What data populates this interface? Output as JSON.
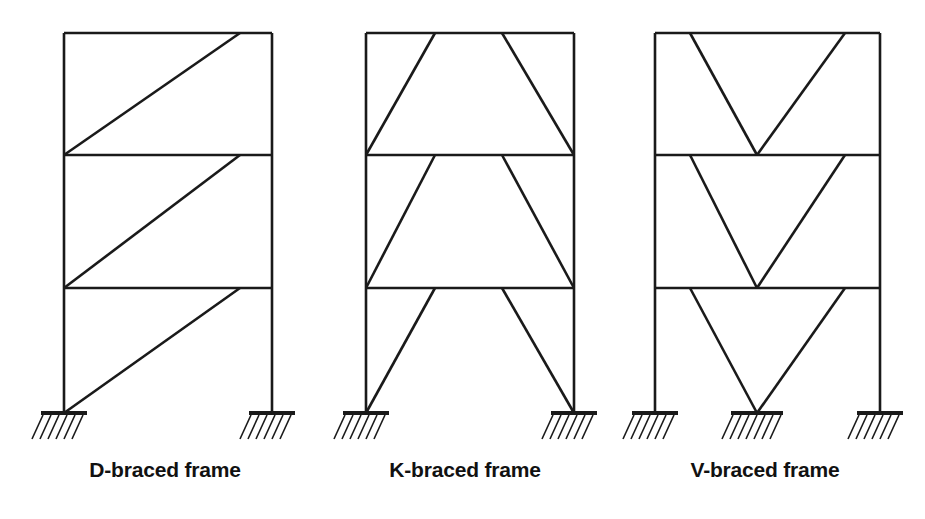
{
  "figure": {
    "type": "engineering-diagram",
    "background_color": "#ffffff",
    "line_color": "#1a1a1a",
    "member_line_width": 2.6,
    "brace_line_width": 2.6,
    "support_line_width": 4.0,
    "hatch_line_width": 1.6
  },
  "labels": {
    "d_frame": "D-braced frame",
    "k_frame": "K-braced frame",
    "v_frame": "V-braced frame"
  },
  "geometry": {
    "story_levels_y": [
      33,
      155,
      288,
      413
    ],
    "roof_y": 33,
    "base_y": 413,
    "stories": 3
  },
  "frames": [
    {
      "id": "d-braced",
      "name": "D-braced frame",
      "label": "D-braced frame",
      "brace_pattern": "single-diagonal",
      "left_column_x": 64,
      "right_column_x": 272,
      "columns": [
        {
          "x": 64,
          "y_top": 33,
          "y_bottom": 413
        },
        {
          "x": 272,
          "y_top": 33,
          "y_bottom": 413
        }
      ],
      "beams": [
        {
          "y": 33,
          "x_left": 64,
          "x_right": 272
        },
        {
          "y": 155,
          "x_left": 64,
          "x_right": 272
        },
        {
          "y": 288,
          "x_left": 64,
          "x_right": 272
        }
      ],
      "braces": [
        {
          "story": 3,
          "x1": 64,
          "y1": 155,
          "x2": 240,
          "y2": 33
        },
        {
          "story": 2,
          "x1": 64,
          "y1": 288,
          "x2": 240,
          "y2": 155
        },
        {
          "story": 1,
          "x1": 64,
          "y1": 413,
          "x2": 240,
          "y2": 288
        }
      ],
      "supports": [
        {
          "x": 64,
          "y": 413,
          "width": 46
        },
        {
          "x": 272,
          "y": 413,
          "width": 46
        }
      ]
    },
    {
      "id": "k-braced",
      "name": "K-braced frame",
      "label": "K-braced frame",
      "brace_pattern": "trapezoid-chevron",
      "left_column_x": 366,
      "right_column_x": 574,
      "columns": [
        {
          "x": 366,
          "y_top": 33,
          "y_bottom": 413
        },
        {
          "x": 574,
          "y_top": 33,
          "y_bottom": 413
        }
      ],
      "beams": [
        {
          "y": 33,
          "x_left": 366,
          "x_right": 574
        },
        {
          "y": 155,
          "x_left": 366,
          "x_right": 574
        },
        {
          "y": 288,
          "x_left": 366,
          "x_right": 574
        }
      ],
      "braces": [
        {
          "story": 3,
          "x1": 366,
          "y1": 155,
          "x2": 435,
          "y2": 33
        },
        {
          "story": 3,
          "x1": 574,
          "y1": 155,
          "x2": 502,
          "y2": 33
        },
        {
          "story": 2,
          "x1": 366,
          "y1": 288,
          "x2": 435,
          "y2": 155
        },
        {
          "story": 2,
          "x1": 574,
          "y1": 288,
          "x2": 502,
          "y2": 155
        },
        {
          "story": 1,
          "x1": 366,
          "y1": 413,
          "x2": 435,
          "y2": 288
        },
        {
          "story": 1,
          "x1": 574,
          "y1": 413,
          "x2": 502,
          "y2": 288
        }
      ],
      "supports": [
        {
          "x": 366,
          "y": 413,
          "width": 46
        },
        {
          "x": 574,
          "y": 413,
          "width": 46
        }
      ]
    },
    {
      "id": "v-braced",
      "name": "V-braced frame",
      "label": "V-braced frame",
      "brace_pattern": "chevron-v",
      "left_column_x": 655,
      "right_column_x": 880,
      "columns": [
        {
          "x": 655,
          "y_top": 33,
          "y_bottom": 413
        },
        {
          "x": 880,
          "y_top": 33,
          "y_bottom": 413
        }
      ],
      "beams": [
        {
          "y": 33,
          "x_left": 655,
          "x_right": 880
        },
        {
          "y": 155,
          "x_left": 655,
          "x_right": 880
        },
        {
          "y": 288,
          "x_left": 655,
          "x_right": 880
        }
      ],
      "braces": [
        {
          "story": 3,
          "x1": 690,
          "y1": 33,
          "x2": 757,
          "y2": 155
        },
        {
          "story": 3,
          "x1": 845,
          "y1": 33,
          "x2": 757,
          "y2": 155
        },
        {
          "story": 2,
          "x1": 690,
          "y1": 155,
          "x2": 757,
          "y2": 288
        },
        {
          "story": 2,
          "x1": 845,
          "y1": 155,
          "x2": 757,
          "y2": 288
        },
        {
          "story": 1,
          "x1": 690,
          "y1": 288,
          "x2": 757,
          "y2": 413
        },
        {
          "story": 1,
          "x1": 845,
          "y1": 288,
          "x2": 757,
          "y2": 413
        }
      ],
      "supports": [
        {
          "x": 655,
          "y": 413,
          "width": 46
        },
        {
          "x": 757,
          "y": 413,
          "width": 52
        },
        {
          "x": 880,
          "y": 413,
          "width": 46
        }
      ]
    }
  ]
}
